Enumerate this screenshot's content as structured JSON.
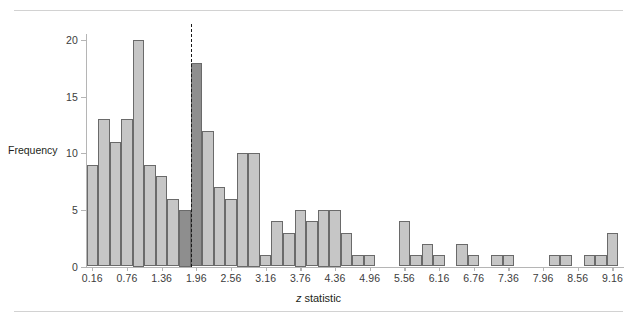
{
  "figure": {
    "name": "z-statistic-histogram",
    "background": "#ffffff"
  },
  "chart_data": {
    "type": "bar",
    "title": "",
    "subtitle": "",
    "xlabel": "z statistic",
    "xlabel_italic_prefix": "z",
    "xlabel_rest": " statistic",
    "ylabel": "Frequency",
    "ylim": [
      0,
      21.5
    ],
    "xlim": [
      0.06,
      9.36
    ],
    "bin_width": 0.2,
    "grid": false,
    "legend": null,
    "y_ticks": [
      0,
      5,
      10,
      15,
      20
    ],
    "y_tick_labels": [
      "0",
      "5",
      "10",
      "15",
      "20"
    ],
    "x_ticks": [
      0.16,
      0.76,
      1.36,
      1.96,
      2.56,
      3.16,
      3.76,
      4.36,
      4.96,
      5.56,
      6.16,
      6.76,
      7.36,
      7.96,
      8.56,
      9.16
    ],
    "x_tick_labels": [
      "0.16",
      "0.76",
      "1.36",
      "1.96",
      "2.56",
      "3.16",
      "3.76",
      "4.36",
      "4.96",
      "5.56",
      "6.16",
      "6.76",
      "7.36",
      "7.96",
      "8.56",
      "9.16"
    ],
    "bin_centers": [
      0.16,
      0.36,
      0.56,
      0.76,
      0.96,
      1.16,
      1.36,
      1.56,
      1.76,
      1.96,
      2.16,
      2.36,
      2.56,
      2.76,
      2.96,
      3.16,
      3.36,
      3.56,
      3.76,
      3.96,
      4.16,
      4.36,
      4.56,
      4.76,
      4.96,
      5.16,
      5.36,
      5.56,
      5.76,
      5.96,
      6.16,
      6.36,
      6.56,
      6.76,
      6.96,
      7.16,
      7.36,
      7.56,
      7.76,
      7.96,
      8.16,
      8.36,
      8.56,
      8.76,
      8.96,
      9.16
    ],
    "values": [
      9,
      13,
      11,
      13,
      20,
      9,
      8,
      6,
      5,
      18,
      12,
      7,
      6,
      10,
      10,
      1,
      4,
      3,
      5,
      4,
      5,
      5,
      3,
      1,
      1,
      0,
      0,
      4,
      1,
      2,
      1,
      0,
      2,
      1,
      0,
      1,
      1,
      0,
      0,
      0,
      1,
      1,
      0,
      1,
      1,
      3
    ],
    "highlighted_bins": [
      8,
      9
    ],
    "colors": {
      "bar_light": "#c6c6c6",
      "bar_dark": "#8e8e8e",
      "bar_edge": "#6a6a6a",
      "axis": "#b5b5b5",
      "text": "#231f20",
      "reference_line": "#1a1a1a",
      "rule": "#d2d2d2"
    },
    "reference_line": {
      "value": 1.96,
      "style": "dashed",
      "label": ""
    },
    "annotations": []
  }
}
